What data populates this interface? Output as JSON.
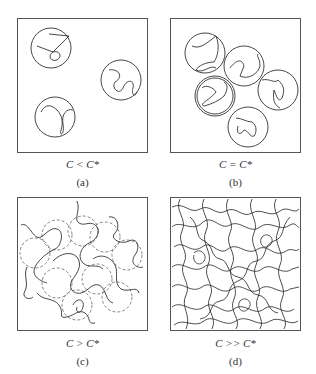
{
  "figure": {
    "panels": [
      {
        "id": "a",
        "condition": "C < C*",
        "tag": "(a)",
        "regime": "dilute",
        "coil_count": 3
      },
      {
        "id": "b",
        "condition": "C = C*",
        "tag": "(b)",
        "regime": "overlap threshold",
        "coil_count": 5
      },
      {
        "id": "c",
        "condition": "C > C*",
        "tag": "(c)",
        "regime": "semidilute",
        "coil_count": 9
      },
      {
        "id": "d",
        "condition": "C >> C*",
        "tag": "(d)",
        "regime": "concentrated",
        "coil_count": 0
      }
    ]
  },
  "colors": {
    "line": "#333333",
    "frame": "#555555",
    "background": "#ffffff"
  }
}
